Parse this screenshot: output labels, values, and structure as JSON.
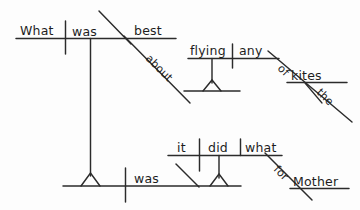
{
  "document": {
    "type": "reed-kellogg-sentence-diagram",
    "sentence": "What was best about flying any of the kites was what it did for Mother.",
    "background_color": "#fdfdfd",
    "ink_color": "#2b2b2b"
  },
  "clauses": {
    "subject_clause": {
      "name": "upper-noun-clause",
      "subject": "What",
      "verb": "was",
      "predicate_nominative": "best",
      "preposition": "about",
      "gerund": "flying",
      "gerund_object": "any",
      "prep2": "of",
      "prep2_object": "kites",
      "article": "the"
    },
    "main_clause": {
      "name": "main-baseline-clause",
      "verb": "was"
    },
    "predicate_clause": {
      "name": "lower-noun-clause",
      "subject": "it",
      "verb": "did",
      "direct_object": "what",
      "preposition": "for",
      "prep_object": "Mother"
    }
  },
  "words": {
    "what_upper": "What",
    "was_upper": "was",
    "best": "best",
    "about": "about",
    "flying": "flying",
    "any": "any",
    "of": "of",
    "kites": "kites",
    "the": "the",
    "was_main": "was",
    "it": "it",
    "did": "did",
    "what_lower": "what",
    "for": "for",
    "mother": "Mother"
  }
}
